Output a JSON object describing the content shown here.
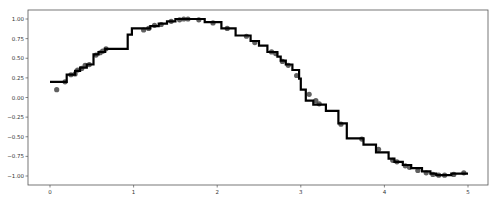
{
  "chart_data": {
    "type": "scatter+step",
    "title": "",
    "xlabel": "",
    "ylabel": "",
    "xlim": [
      -0.25,
      5.25
    ],
    "ylim": [
      -1.1,
      1.1
    ],
    "grid": false,
    "legend": null,
    "x_ticks": [
      0,
      1,
      2,
      3,
      4,
      5
    ],
    "x_tick_labels": [
      "0",
      "1",
      "2",
      "3",
      "4",
      "5"
    ],
    "y_ticks": [
      1.0,
      0.75,
      0.5,
      0.25,
      0.0,
      -0.25,
      -0.5,
      -0.75,
      -1.0
    ],
    "y_tick_labels": [
      "1.00",
      "0.75",
      "0.50",
      "0.25",
      "0.00",
      "−0.25",
      "−0.50",
      "−0.75",
      "−1.00"
    ],
    "series": [
      {
        "name": "data",
        "kind": "scatter",
        "color": "#444444",
        "points": [
          [
            0.08,
            0.1
          ],
          [
            0.18,
            0.2
          ],
          [
            0.25,
            0.29
          ],
          [
            0.3,
            0.3
          ],
          [
            0.33,
            0.35
          ],
          [
            0.38,
            0.37
          ],
          [
            0.42,
            0.41
          ],
          [
            0.47,
            0.42
          ],
          [
            0.55,
            0.54
          ],
          [
            0.6,
            0.57
          ],
          [
            0.63,
            0.59
          ],
          [
            0.67,
            0.62
          ],
          [
            1.12,
            0.86
          ],
          [
            1.18,
            0.88
          ],
          [
            1.25,
            0.92
          ],
          [
            1.33,
            0.93
          ],
          [
            1.45,
            0.97
          ],
          [
            1.55,
            0.99
          ],
          [
            1.6,
            1.0
          ],
          [
            1.65,
            1.0
          ],
          [
            1.78,
            0.99
          ],
          [
            1.95,
            0.95
          ],
          [
            2.12,
            0.88
          ],
          [
            2.35,
            0.78
          ],
          [
            2.45,
            0.7
          ],
          [
            2.65,
            0.58
          ],
          [
            2.7,
            0.56
          ],
          [
            2.78,
            0.46
          ],
          [
            2.85,
            0.41
          ],
          [
            2.95,
            0.28
          ],
          [
            3.1,
            0.04
          ],
          [
            3.18,
            -0.04
          ],
          [
            3.22,
            -0.08
          ],
          [
            3.48,
            -0.34
          ],
          [
            3.73,
            -0.53
          ],
          [
            3.93,
            -0.66
          ],
          [
            4.1,
            -0.8
          ],
          [
            4.15,
            -0.82
          ],
          [
            4.25,
            -0.87
          ],
          [
            4.3,
            -0.89
          ],
          [
            4.4,
            -0.93
          ],
          [
            4.5,
            -0.96
          ],
          [
            4.58,
            -0.98
          ],
          [
            4.65,
            -0.99
          ],
          [
            4.72,
            -0.99
          ],
          [
            4.83,
            -0.98
          ],
          [
            4.95,
            -0.96
          ]
        ]
      },
      {
        "name": "prediction",
        "kind": "step",
        "color": "#000000",
        "points": [
          [
            0.0,
            0.2
          ],
          [
            0.2,
            0.2
          ],
          [
            0.2,
            0.29
          ],
          [
            0.3,
            0.29
          ],
          [
            0.3,
            0.34
          ],
          [
            0.36,
            0.34
          ],
          [
            0.36,
            0.38
          ],
          [
            0.44,
            0.38
          ],
          [
            0.44,
            0.42
          ],
          [
            0.52,
            0.42
          ],
          [
            0.52,
            0.55
          ],
          [
            0.58,
            0.55
          ],
          [
            0.58,
            0.58
          ],
          [
            0.66,
            0.58
          ],
          [
            0.66,
            0.62
          ],
          [
            0.93,
            0.62
          ],
          [
            0.93,
            0.8
          ],
          [
            0.98,
            0.8
          ],
          [
            0.98,
            0.88
          ],
          [
            1.2,
            0.88
          ],
          [
            1.2,
            0.91
          ],
          [
            1.3,
            0.91
          ],
          [
            1.3,
            0.94
          ],
          [
            1.4,
            0.94
          ],
          [
            1.4,
            0.97
          ],
          [
            1.5,
            0.97
          ],
          [
            1.5,
            1.0
          ],
          [
            1.85,
            1.0
          ],
          [
            1.85,
            0.96
          ],
          [
            2.05,
            0.96
          ],
          [
            2.05,
            0.88
          ],
          [
            2.22,
            0.88
          ],
          [
            2.22,
            0.79
          ],
          [
            2.4,
            0.79
          ],
          [
            2.4,
            0.72
          ],
          [
            2.5,
            0.72
          ],
          [
            2.5,
            0.66
          ],
          [
            2.6,
            0.66
          ],
          [
            2.6,
            0.58
          ],
          [
            2.72,
            0.58
          ],
          [
            2.72,
            0.52
          ],
          [
            2.76,
            0.52
          ],
          [
            2.76,
            0.47
          ],
          [
            2.82,
            0.47
          ],
          [
            2.82,
            0.42
          ],
          [
            2.9,
            0.42
          ],
          [
            2.9,
            0.35
          ],
          [
            2.98,
            0.35
          ],
          [
            2.98,
            0.24
          ],
          [
            3.0,
            0.24
          ],
          [
            3.0,
            0.1
          ],
          [
            3.06,
            0.1
          ],
          [
            3.06,
            -0.04
          ],
          [
            3.15,
            -0.04
          ],
          [
            3.15,
            -0.09
          ],
          [
            3.3,
            -0.09
          ],
          [
            3.3,
            -0.17
          ],
          [
            3.45,
            -0.17
          ],
          [
            3.45,
            -0.33
          ],
          [
            3.55,
            -0.33
          ],
          [
            3.55,
            -0.52
          ],
          [
            3.75,
            -0.52
          ],
          [
            3.75,
            -0.6
          ],
          [
            3.9,
            -0.6
          ],
          [
            3.9,
            -0.7
          ],
          [
            4.05,
            -0.7
          ],
          [
            4.05,
            -0.78
          ],
          [
            4.12,
            -0.78
          ],
          [
            4.12,
            -0.82
          ],
          [
            4.22,
            -0.82
          ],
          [
            4.22,
            -0.86
          ],
          [
            4.32,
            -0.86
          ],
          [
            4.32,
            -0.9
          ],
          [
            4.45,
            -0.9
          ],
          [
            4.45,
            -0.94
          ],
          [
            4.55,
            -0.94
          ],
          [
            4.55,
            -0.97
          ],
          [
            4.62,
            -0.97
          ],
          [
            4.62,
            -0.99
          ],
          [
            4.8,
            -0.99
          ],
          [
            4.8,
            -0.97
          ],
          [
            5.0,
            -0.97
          ]
        ]
      }
    ]
  },
  "layout": {
    "frame": {
      "left": 28,
      "top": 10,
      "right": 488,
      "bottom": 185
    },
    "x_origin_px": 50,
    "x_px_per_unit": 83.6,
    "y_origin_px": 97.5,
    "y_px_per_unit": 78.5
  }
}
